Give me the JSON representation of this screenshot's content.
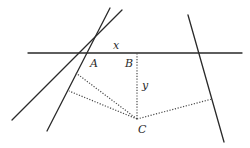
{
  "diagram": {
    "labels": {
      "x": "x",
      "y": "y",
      "A": "A",
      "B": "B",
      "C": "C"
    },
    "colors": {
      "line": "#2a2a2a",
      "dotted": "#4a4a4a",
      "background": "#ffffff"
    },
    "lines": {
      "horizontal": {
        "x1": 28,
        "y1": 53,
        "x2": 242,
        "y2": 53
      },
      "left_steep": {
        "x1": 110,
        "y1": 8,
        "x2": 47,
        "y2": 131
      },
      "left_shallow": {
        "x1": 122,
        "y1": 10,
        "x2": 12,
        "y2": 120
      },
      "right": {
        "x1": 188,
        "y1": 15,
        "x2": 224,
        "y2": 142
      }
    },
    "points": {
      "A": {
        "x": 84,
        "y": 53
      },
      "B": {
        "x": 137,
        "y": 53
      },
      "C": {
        "x": 137,
        "y": 119
      }
    },
    "dotted_segments": [
      {
        "from": "C",
        "to": [
          75,
          75
        ]
      },
      {
        "from": "C",
        "to": [
          69,
          91
        ]
      },
      {
        "from": "C",
        "to": "B"
      },
      {
        "from": "C",
        "to": [
          212,
          99
        ]
      }
    ]
  }
}
